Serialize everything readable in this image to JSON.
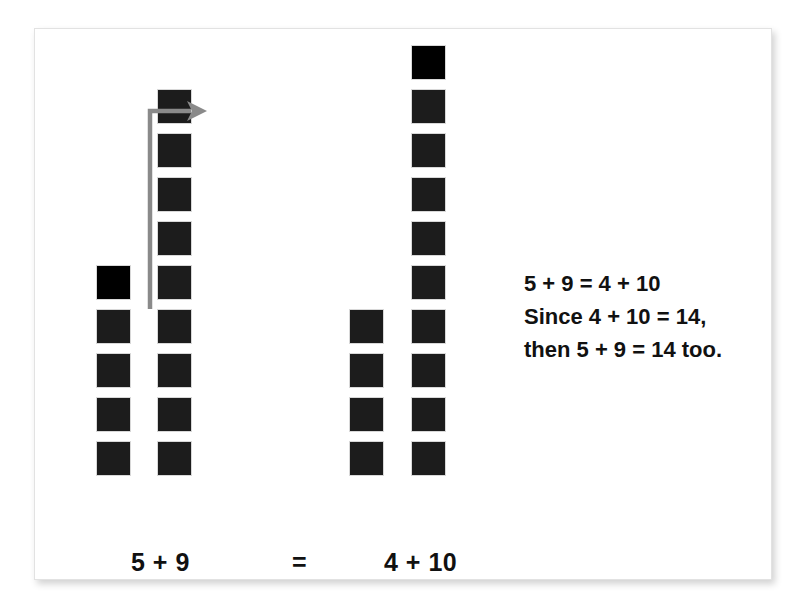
{
  "figure": {
    "title_alt": "Making ten: 5 + 9 = 4 + 10 counter diagram",
    "background_color": "#ffffff",
    "card_border_color": "#e2e2e2",
    "counter_color": "#1c1c1c",
    "moved_counter_color": "#000000",
    "arrow_color": "#8a8a8a",
    "text_color": "#111111"
  },
  "columns": [
    {
      "id": "col-5",
      "label": "5",
      "count": 5,
      "moved_index": 0,
      "x": 96,
      "bottom_y": 474
    },
    {
      "id": "col-9",
      "label": "9",
      "count": 9,
      "moved_index": -1,
      "x": 157,
      "bottom_y": 474
    },
    {
      "id": "col-4",
      "label": "4",
      "count": 4,
      "moved_index": -1,
      "x": 349,
      "bottom_y": 474
    },
    {
      "id": "col-10",
      "label": "10",
      "count": 10,
      "moved_index": 0,
      "x": 411,
      "bottom_y": 474
    }
  ],
  "captions": {
    "left": "5 + 9",
    "equals": "=",
    "right": "4 + 10"
  },
  "explanation": {
    "lines": [
      "5 + 9 = 4 + 10",
      "Since 4 + 10 = 14,",
      "then 5 + 9 = 14 too."
    ]
  },
  "arrow": {
    "name": "move-one-counter-arrow",
    "description": "elbow arrow from top of the 5-column up and to the right toward the 9-column"
  },
  "chart_data": {
    "type": "bar",
    "title": "5 + 9 = 4 + 10",
    "categories": [
      "5",
      "9",
      "4",
      "10"
    ],
    "values": [
      5,
      9,
      4,
      10
    ],
    "xlabel": "",
    "ylabel": "number of counters",
    "ylim": [
      0,
      10
    ],
    "annotations": [
      "5 + 9 = 4 + 10",
      "Since 4 + 10 = 14,",
      "then 5 + 9 = 14 too."
    ]
  }
}
